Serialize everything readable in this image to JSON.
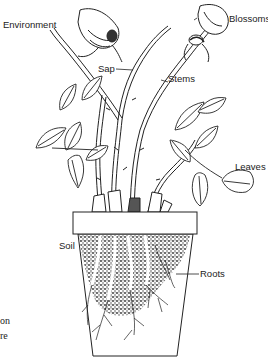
{
  "diagram": {
    "labels": {
      "environment": "Environment",
      "blossoms": "Blossoms",
      "sap": "Sap",
      "stems": "Stems",
      "leaves": "Leaves",
      "soil": "Soil",
      "roots": "Roots"
    },
    "cropped_text": {
      "line1": "on",
      "line2": "re"
    },
    "colors": {
      "ink": "#222222",
      "background": "#ffffff",
      "soil": "#3a3a3a"
    }
  }
}
